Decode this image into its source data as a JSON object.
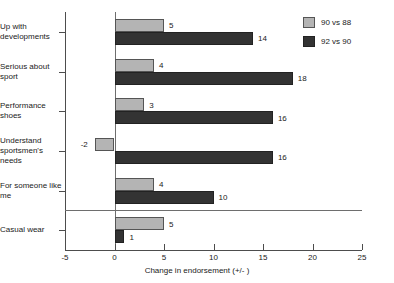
{
  "chart_data": {
    "type": "bar",
    "orientation": "horizontal",
    "title": "",
    "xlabel": "Change in endorsement (+/- )",
    "ylabel": "",
    "xlim": [
      -5,
      25
    ],
    "xticks": [
      -5,
      0,
      5,
      10,
      15,
      20,
      25
    ],
    "xticklabels": [
      "-5",
      "0",
      "5",
      "10",
      "15",
      "20",
      "25"
    ],
    "grid": false,
    "legend_position": "top-right",
    "categories": [
      "Up with developments",
      "Serious about sport",
      "Performance shoes",
      "Understand sportsmen's needs",
      "For someone like me",
      "Casual wear"
    ],
    "series": [
      {
        "name": "90 vs 88",
        "color": "#b4b4b4",
        "values": [
          5,
          4,
          3,
          -2,
          4,
          5
        ]
      },
      {
        "name": "92 vs 90",
        "color": "#333333",
        "values": [
          14,
          18,
          16,
          16,
          10,
          1
        ]
      }
    ],
    "separator_after_category_index": 4
  },
  "legend": {
    "items": [
      {
        "label": "90 vs 88"
      },
      {
        "label": "92 vs 90"
      }
    ]
  }
}
